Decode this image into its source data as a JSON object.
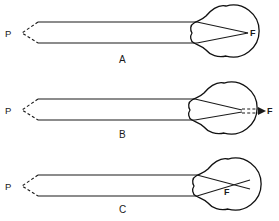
{
  "figure": {
    "background_color": "#ffffff",
    "line_color": "#1a1a1a",
    "panels": [
      {
        "id": "A",
        "label": "A",
        "condition": "emmetropia",
        "object_label": "P",
        "focus_label": "F",
        "focus_location": "on retina",
        "object_x": 12,
        "object_y": 33,
        "focus_x": 249,
        "focus_y": 33,
        "panel_label_x": 122,
        "panel_label_y": 62,
        "eye_center_x": 218,
        "eye_center_y": 31,
        "eye_radius": 26,
        "ray_top_y": 22,
        "ray_bottom_y": 43,
        "ray_start_x": 38,
        "ray_end_x": 196,
        "dashed_continuation": false
      },
      {
        "id": "B",
        "label": "B",
        "condition": "hyperopia",
        "object_label": "P",
        "focus_label": "F",
        "focus_location": "behind retina",
        "object_x": 12,
        "object_y": 110,
        "focus_x": 268,
        "focus_y": 110,
        "panel_label_x": 122,
        "panel_label_y": 137,
        "eye_center_x": 216,
        "eye_center_y": 108,
        "eye_radius": 26,
        "ray_top_y": 99,
        "ray_bottom_y": 120,
        "ray_start_x": 38,
        "ray_end_x": 194,
        "dashed_continuation": true
      },
      {
        "id": "C",
        "label": "C",
        "condition": "myopia",
        "object_label": "P",
        "focus_label": "F",
        "focus_location": "in front of retina",
        "object_x": 12,
        "object_y": 185,
        "focus_x": 229,
        "focus_y": 190,
        "panel_label_x": 122,
        "panel_label_y": 211,
        "eye_center_x": 220,
        "eye_center_y": 184,
        "eye_radius": 26,
        "ray_top_y": 175,
        "ray_bottom_y": 196,
        "ray_start_x": 38,
        "ray_end_x": 196,
        "dashed_continuation": false
      }
    ]
  }
}
